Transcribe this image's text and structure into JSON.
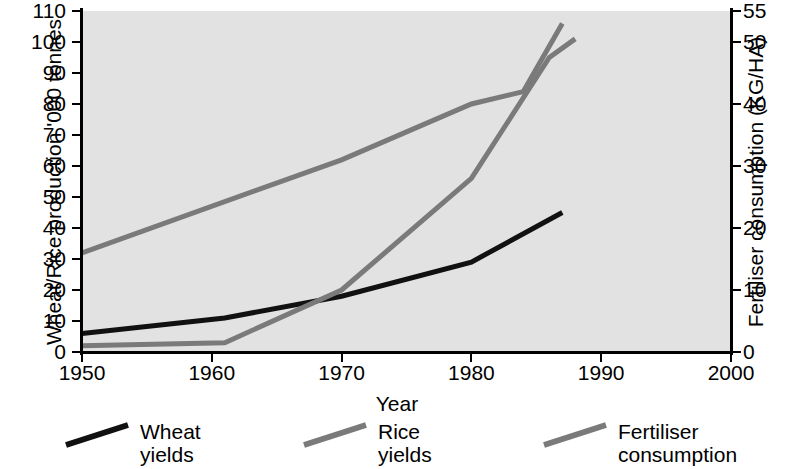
{
  "chart_data": {
    "type": "line",
    "title": "",
    "xlabel": "Year",
    "ylabel": "Wheat/Rice production '000 tonnes",
    "y2label": "Fertiliser consumption (KG/HA)",
    "xlim": [
      1950,
      2000
    ],
    "ylim": [
      0,
      110
    ],
    "y2lim": [
      0,
      55
    ],
    "grid": false,
    "legend_position": "below",
    "xticks": [
      1950,
      1960,
      1970,
      1980,
      1990,
      2000
    ],
    "xtick_labels": [
      "1950",
      "1960",
      "1970",
      "1980",
      "1990",
      "2000"
    ],
    "yticks": [
      0,
      10,
      20,
      30,
      40,
      50,
      60,
      70,
      80,
      90,
      100,
      110
    ],
    "ytick_labels": [
      "0",
      "10",
      "20",
      "30",
      "40",
      "50",
      "60",
      "70",
      "80",
      "90",
      "100",
      "110"
    ],
    "y2ticks": [
      0,
      10,
      20,
      30,
      40,
      50,
      55
    ],
    "y2tick_labels": [
      "0",
      "10",
      "20",
      "30",
      "40",
      "50",
      "55"
    ],
    "series": [
      {
        "name": "Wheat yields",
        "axis": "left",
        "color": "#111111",
        "width": 5,
        "points": [
          [
            1950,
            6
          ],
          [
            1961,
            11
          ],
          [
            1970,
            18
          ],
          [
            1980,
            29
          ],
          [
            1987,
            45
          ]
        ]
      },
      {
        "name": "Rice yields",
        "axis": "left",
        "color": "#7a7a7a",
        "width": 5,
        "points": [
          [
            1950,
            2
          ],
          [
            1961,
            3
          ],
          [
            1970,
            20
          ],
          [
            1980,
            56
          ],
          [
            1986,
            95
          ],
          [
            1988,
            101
          ]
        ]
      },
      {
        "name": "Fertiliser consumption",
        "axis": "right",
        "color": "#7a7a7a",
        "width": 5,
        "points": [
          [
            1950,
            16
          ],
          [
            1970,
            31
          ],
          [
            1980,
            40
          ],
          [
            1984,
            42
          ],
          [
            1987,
            53
          ]
        ]
      }
    ]
  },
  "legend": {
    "items": [
      {
        "label": "Wheat yields",
        "color": "#111111"
      },
      {
        "label": "Rice yields",
        "color": "#7a7a7a"
      },
      {
        "label": "Fertiliser\nconsumption",
        "color": "#7a7a7a"
      }
    ]
  },
  "caption": {
    "text": ""
  }
}
